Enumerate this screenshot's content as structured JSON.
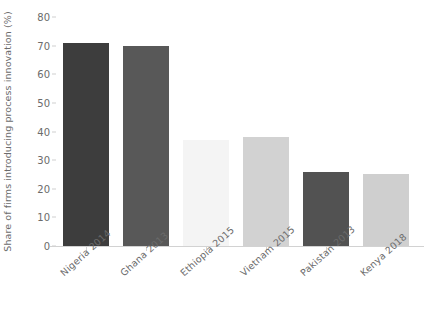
{
  "chart_data": {
    "type": "bar",
    "title": "",
    "xlabel": "",
    "ylabel": "Share of firms introducing process innovation (%)",
    "categories": [
      "Nigeria 2014",
      "Ghana 2013",
      "Ethiopia 2015",
      "Vietnam 2015",
      "Pakistan 2013",
      "Kenya 2018"
    ],
    "values": [
      71,
      70,
      37,
      38,
      26,
      25
    ],
    "colors": [
      "#3d3d3d",
      "#585858",
      "#f4f4f4",
      "#d2d2d2",
      "#525252",
      "#cfcfcf"
    ],
    "ylim": [
      0,
      80
    ],
    "yticks": [
      0,
      10,
      20,
      30,
      40,
      50,
      60,
      70,
      80
    ],
    "ytick_labels": [
      "0",
      "10",
      "20",
      "30",
      "40",
      "50",
      "60",
      "70",
      "80"
    ],
    "grid": false,
    "legend": "none",
    "axis_color": "#d2d2d2",
    "text_color": "#6b6b6b"
  },
  "top_caption": ""
}
